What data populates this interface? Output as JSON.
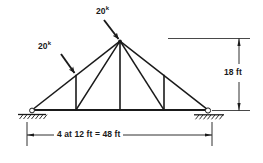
{
  "figure": {
    "type": "structural-truss-diagram",
    "background_color": "#ffffff",
    "line_color": "#1a1a1a"
  },
  "loads": [
    {
      "id": "apex-load",
      "magnitude": "20",
      "unit_superscript": "k",
      "label": "20k",
      "applied_at": "apex joint",
      "direction": "down-right"
    },
    {
      "id": "left-panel-load",
      "magnitude": "20",
      "unit_superscript": "k",
      "label": "20k",
      "applied_at": "left top-chord panel point",
      "direction": "down-right"
    }
  ],
  "dimensions": [
    {
      "id": "span-dimension",
      "text": "4 at 12 ft = 48 ft",
      "orientation": "horizontal",
      "panels": 4,
      "panel_length_ft": 12,
      "total_length_ft": 48,
      "unit": "ft"
    },
    {
      "id": "height-dimension",
      "text": "18 ft",
      "orientation": "vertical",
      "value_ft": 18,
      "unit": "ft"
    }
  ],
  "supports": [
    {
      "id": "left-support",
      "type": "pin",
      "symbol": "hatched-ground"
    },
    {
      "id": "right-support",
      "type": "roller",
      "symbol": "circle-on-hatched-ground"
    }
  ],
  "geometry": {
    "span_px": {
      "left": 32,
      "right": 208
    },
    "bottom_chord_y": 110,
    "apex": {
      "x": 120,
      "y": 41
    },
    "bottom_panel_points_x": [
      32,
      76,
      120,
      164,
      208
    ],
    "top_chord_left_panel_point": {
      "x": 76,
      "y": 75
    },
    "top_chord_right_panel_point": {
      "x": 164,
      "y": 75
    }
  }
}
